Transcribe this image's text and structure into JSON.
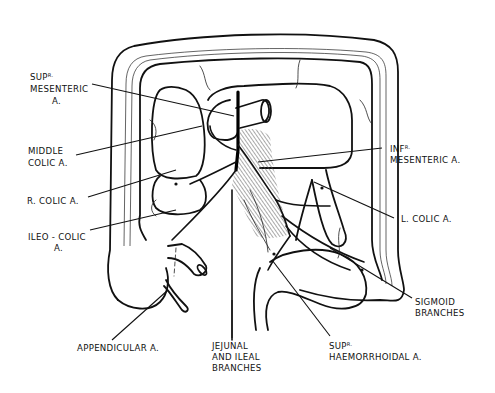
{
  "diagram": {
    "labels": {
      "sup_mesenteric": {
        "prefix": "SUP",
        "sup": "R.",
        "line2": "MESENTERIC",
        "line3": "A."
      },
      "middle_colic": {
        "line1": "MIDDLE",
        "line2": "COLIC  A."
      },
      "r_colic": {
        "line1": "R.  COLIC  A."
      },
      "ileo_colic": {
        "line1": "ILEO - COLIC",
        "line2": "A."
      },
      "appendicular": {
        "line1": "APPENDICULAR  A."
      },
      "jejunal_ileal": {
        "line1": "JEJUNAL",
        "line2": "AND  ILEAL",
        "line3": "BRANCHES"
      },
      "sup_haemorrhoidal": {
        "prefix": "SUP",
        "sup": "R.",
        "line2": "HAEMORRHOIDAL  A."
      },
      "sigmoid": {
        "line1": "SIGMOID",
        "line2": "BRANCHES"
      },
      "l_colic": {
        "line1": "L.  COLIC  A."
      },
      "inf_mesenteric": {
        "prefix": "INF",
        "sup": "R.",
        "line2": "MESENTERIC  A."
      }
    },
    "colors": {
      "ink": "#111111",
      "background": "#ffffff",
      "hatch": "#555555"
    }
  }
}
